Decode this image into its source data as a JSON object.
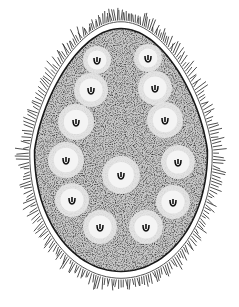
{
  "illustration": {
    "subject": "stippled drawing of a ciliated ovoid cell with internal vesicles",
    "colors": {
      "background": "#ffffff",
      "ink": "#1a1a1a",
      "fill": "#bdbdbd",
      "vesicle": "#f4f4f4"
    },
    "body": {
      "cx": 121,
      "cy": 150,
      "rx": 96,
      "ry": 135
    },
    "vesicles": [
      {
        "x": 97,
        "y": 60,
        "r": 14
      },
      {
        "x": 148,
        "y": 58,
        "r": 14
      },
      {
        "x": 91,
        "y": 90,
        "r": 17
      },
      {
        "x": 155,
        "y": 88,
        "r": 17
      },
      {
        "x": 76,
        "y": 122,
        "r": 18
      },
      {
        "x": 165,
        "y": 120,
        "r": 18
      },
      {
        "x": 66,
        "y": 160,
        "r": 18
      },
      {
        "x": 178,
        "y": 162,
        "r": 17
      },
      {
        "x": 121,
        "y": 175,
        "r": 19
      },
      {
        "x": 72,
        "y": 200,
        "r": 17
      },
      {
        "x": 173,
        "y": 202,
        "r": 17
      },
      {
        "x": 100,
        "y": 227,
        "r": 17
      },
      {
        "x": 146,
        "y": 227,
        "r": 17
      }
    ]
  }
}
